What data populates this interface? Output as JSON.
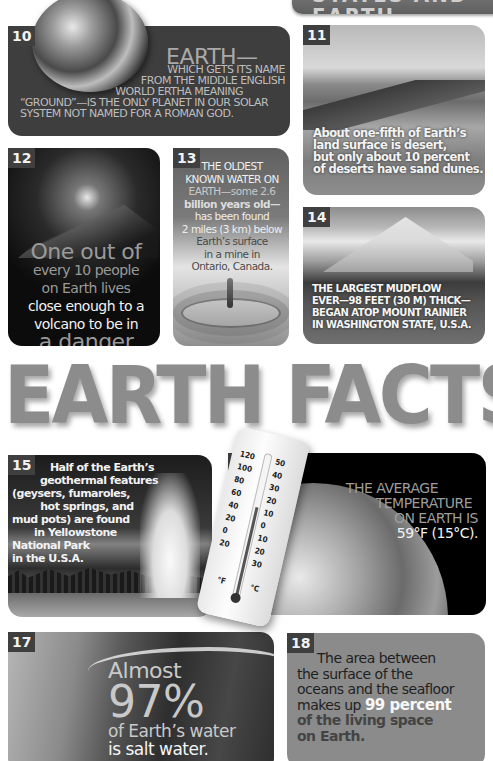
{
  "banner": {
    "partial_title": "STATES AND EARTH"
  },
  "title": "EARTH FACTS",
  "colors": {
    "background": "#ffffff",
    "title_gray": "#8c8c8c",
    "card_dark": "#3e3e3e",
    "card_18": "#8b8b8b",
    "number_badge": "#3f3f3f"
  },
  "facts": [
    {
      "number": "10",
      "image": "earth-globe",
      "headline": "EARTH—",
      "lines": [
        "WHICH GETS ITS NAME",
        "FROM THE MIDDLE ENGLISH",
        "WORLD ERTHA MEANING",
        "“GROUND”—IS THE ONLY PLANET IN OUR SOLAR",
        "SYSTEM NOT NAMED FOR A ROMAN GOD."
      ]
    },
    {
      "number": "11",
      "image": "desert-dunes",
      "lines": [
        "About one-fifth of Earth’s",
        "land surface is desert,",
        "but only about 10 percent",
        "of deserts have sand dunes."
      ]
    },
    {
      "number": "12",
      "image": "erupting-volcano",
      "lines": [
        "One out of",
        "every 10 people",
        "on Earth lives",
        "close enough to a",
        "volcano to be in",
        "a danger zone."
      ]
    },
    {
      "number": "13",
      "image": "water-droplet",
      "lines": [
        "THE OLDEST",
        "KNOWN WATER ON",
        "EARTH—some 2.6",
        "billion years old—",
        "has been found",
        "2 miles (3 km) below",
        "Earth’s surface",
        "in a mine in",
        "Ontario, Canada."
      ]
    },
    {
      "number": "14",
      "image": "mount-rainier",
      "lines": [
        "THE LARGEST MUDFLOW",
        "EVER—98 FEET (30 M) THICK—",
        "BEGAN ATOP MOUNT RAINIER",
        "IN WASHINGTON STATE, U.S.A."
      ]
    },
    {
      "number": "15",
      "image": "yellowstone-geyser",
      "lines": [
        "Half of the Earth’s",
        "geothermal features",
        "(geysers, fumaroles,",
        "hot springs, and",
        "mud pots) are found",
        "in Yellowstone",
        "National Park",
        "in the U.S.A."
      ]
    },
    {
      "number": "16",
      "image": "thermometer-and-earth",
      "lines": [
        "THE AVERAGE",
        "TEMPERATURE",
        "ON EARTH IS",
        "59°F (15°C)."
      ],
      "thermometer": {
        "fahrenheit_ticks": [
          "120",
          "100",
          "80",
          "60",
          "40",
          "20",
          "0",
          "20"
        ],
        "celsius_ticks": [
          "50",
          "40",
          "30",
          "20",
          "10",
          "0",
          "10",
          "20",
          "30"
        ],
        "unit_f": "°F",
        "unit_c": "°C"
      }
    },
    {
      "number": "17",
      "image": "ocean-wave",
      "lines": [
        "Almost",
        "97%",
        "of Earth’s water",
        "is salt water."
      ]
    },
    {
      "number": "18",
      "lines": [
        "The area between",
        "the surface of the",
        "oceans and the seafloor",
        "makes up",
        "99 percent",
        "of the living space",
        "on Earth."
      ]
    }
  ]
}
